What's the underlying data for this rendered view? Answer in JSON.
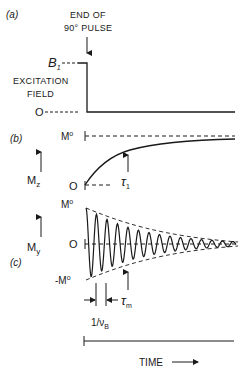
{
  "panels": {
    "a": {
      "tag": "(a)",
      "pulse_label_line1": "END OF",
      "pulse_label_line2": "90° PULSE",
      "level_high": "B",
      "level_high_sub": "1",
      "axis_label_line1": "EXCITATION",
      "axis_label_line2": "FIELD",
      "level_zero": "O"
    },
    "b": {
      "tag": "(b)",
      "level_high": "M",
      "level_high_sup": "o",
      "axis_label": "M",
      "axis_label_sub": "z",
      "level_zero": "O",
      "time_const": "τ",
      "time_const_sub": "1"
    },
    "c": {
      "tag": "(c)",
      "level_high": "M",
      "level_high_sup": "o",
      "level_zero": "O",
      "level_low": "-M",
      "level_low_sup": "o",
      "axis_label": "M",
      "axis_label_sub": "y",
      "time_const": "τ",
      "time_const_sub": "m",
      "period_label": "1/ν",
      "period_label_sub": "B"
    }
  },
  "time_axis": {
    "label": "TIME",
    "arrow": "⟶"
  },
  "colors": {
    "ink": "#1a1a1a",
    "background": "#ffffff"
  }
}
